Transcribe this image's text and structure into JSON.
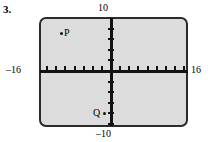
{
  "problem": {
    "number": "3."
  },
  "graph": {
    "window": {
      "xmin_label": "–16",
      "xmax_label": "16",
      "ymax_label": "10",
      "ymin_label": "–10",
      "xmin": -16,
      "xmax": 16,
      "ymin": -10,
      "ymax": 10,
      "x_scale": 2,
      "y_scale": 2
    },
    "style": {
      "screen_fill": "#dcdcdc",
      "border_color": "#2b2b2b",
      "axis_color": "#111111"
    },
    "points": [
      {
        "label": "P",
        "dot_side": "left",
        "approx_x": -13,
        "approx_y": 7
      },
      {
        "label": "Q",
        "dot_side": "right",
        "approx_x": -1,
        "approx_y": -8
      }
    ]
  },
  "chart_data": {
    "type": "scatter",
    "title": "",
    "xlabel": "",
    "ylabel": "",
    "xlim": [
      -16,
      16
    ],
    "ylim": [
      -10,
      10
    ],
    "grid": false,
    "legend": "none",
    "xtick_labels": [
      "–16",
      "16"
    ],
    "ytick_labels": [
      "–10",
      "10"
    ],
    "tick_spacing_x": 2,
    "tick_spacing_y": 2,
    "series": [
      {
        "name": "plotted points",
        "points": [
          {
            "label": "P",
            "x": -13,
            "y": 7
          },
          {
            "label": "Q",
            "x": -1,
            "y": -8
          }
        ]
      }
    ],
    "annotations": [
      "P",
      "Q"
    ]
  }
}
